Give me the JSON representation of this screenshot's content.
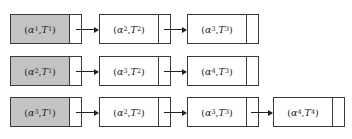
{
  "diagram": {
    "type": "linked-list-chains",
    "colors": {
      "head_fill": "#c3c3c3",
      "node_fill": "#ffffff",
      "border": "#3a3a3a",
      "arrow": "#222222"
    },
    "rows": [
      {
        "nodes": [
          {
            "alpha": "α",
            "alpha_sub": "1",
            "T": "T",
            "T_sub": "1",
            "head": true
          },
          {
            "alpha": "α",
            "alpha_sub": "2",
            "T": "T",
            "T_sub": "2",
            "head": false
          },
          {
            "alpha": "α",
            "alpha_sub": "3",
            "T": "T",
            "T_sub": "3",
            "head": false
          }
        ]
      },
      {
        "nodes": [
          {
            "alpha": "α",
            "alpha_sub": "2",
            "T": "T",
            "T_sub": "1",
            "head": true
          },
          {
            "alpha": "α",
            "alpha_sub": "3",
            "T": "T",
            "T_sub": "2",
            "head": false
          },
          {
            "alpha": "α",
            "alpha_sub": "4",
            "T": "T",
            "T_sub": "3",
            "head": false
          }
        ]
      },
      {
        "nodes": [
          {
            "alpha": "α",
            "alpha_sub": "3",
            "T": "T",
            "T_sub": "1",
            "head": true
          },
          {
            "alpha": "α",
            "alpha_sub": "2",
            "T": "T",
            "T_sub": "2",
            "head": false
          },
          {
            "alpha": "α",
            "alpha_sub": "3",
            "T": "T",
            "T_sub": "3",
            "head": false
          },
          {
            "alpha": "α",
            "alpha_sub": "4",
            "T": "T",
            "T_sub": "4",
            "head": false
          }
        ]
      }
    ]
  }
}
